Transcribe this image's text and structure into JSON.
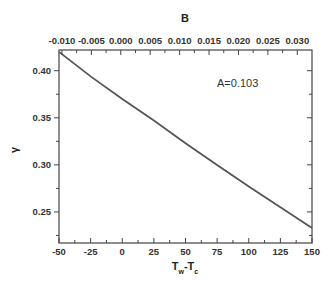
{
  "chart_data": {
    "type": "line",
    "title": "",
    "xlabel": "Tw-Tc",
    "xlabel_main": "T",
    "xlabel_sub1": "w",
    "xlabel_mid": "-T",
    "xlabel_sub2": "c",
    "ylabel": "γ",
    "x2label": "B",
    "xlim": [
      -50,
      150
    ],
    "ylim": [
      0.217,
      0.422
    ],
    "x2lim": [
      -0.0105,
      0.0325
    ],
    "xticks": [
      -50,
      -25,
      0,
      25,
      50,
      75,
      100,
      125,
      150
    ],
    "xtick_labels": [
      "-50",
      "-25",
      "0",
      "25",
      "50",
      "75",
      "100",
      "125",
      "150"
    ],
    "yticks": [
      0.25,
      0.3,
      0.35,
      0.4
    ],
    "ytick_labels": [
      "0.25",
      "0.30",
      "0.35",
      "0.40"
    ],
    "x2ticks": [
      -0.01,
      -0.005,
      0.0,
      0.005,
      0.01,
      0.015,
      0.02,
      0.025,
      0.03
    ],
    "x2tick_labels": [
      "-0.010",
      "-0.005",
      "0.000",
      "0.005",
      "0.010",
      "0.015",
      "0.020",
      "0.025",
      "0.030"
    ],
    "series": [
      {
        "name": "A=0.103",
        "x": [
          -50,
          -25,
          0,
          25,
          50,
          75,
          100,
          125,
          150
        ],
        "y": [
          0.42,
          0.394,
          0.37,
          0.347,
          0.323,
          0.3,
          0.277,
          0.255,
          0.233
        ],
        "color": "#555555"
      }
    ],
    "annotations": [
      {
        "text": "A=0.103",
        "x": 110,
        "y": 0.385
      }
    ],
    "grid": false,
    "legend": "none"
  }
}
